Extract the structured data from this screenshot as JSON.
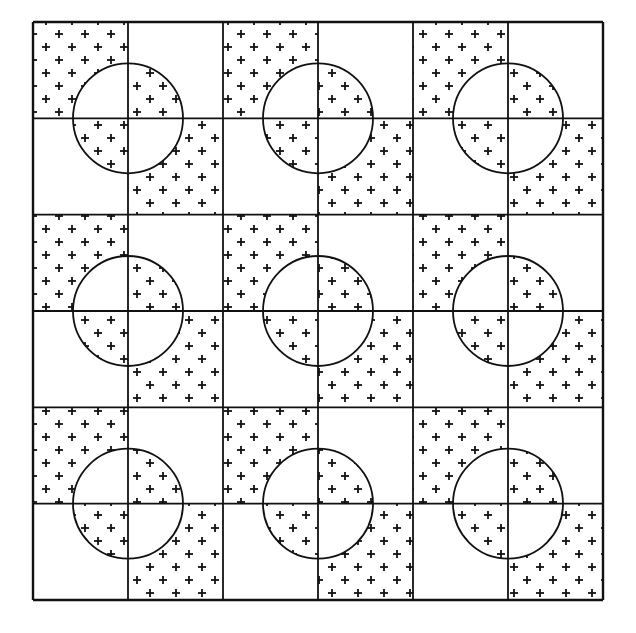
{
  "figure": {
    "title": "",
    "grid": {
      "left": 33,
      "top": 22,
      "right": 603,
      "bottom": 600,
      "cols": 6,
      "rows": 6
    },
    "blocks": {
      "rows": 3,
      "cols": 3
    },
    "circle_radius": 55,
    "pattern": {
      "outside_filled_quadrants": [
        "top-left",
        "bottom-right"
      ],
      "inside_circle_filled_quadrants": [
        "top-right",
        "bottom-left"
      ],
      "texture_glyph": "plus-sign",
      "texture_spacing": 26
    },
    "colors": {
      "ink": "#111111",
      "paper": "#ffffff"
    }
  }
}
